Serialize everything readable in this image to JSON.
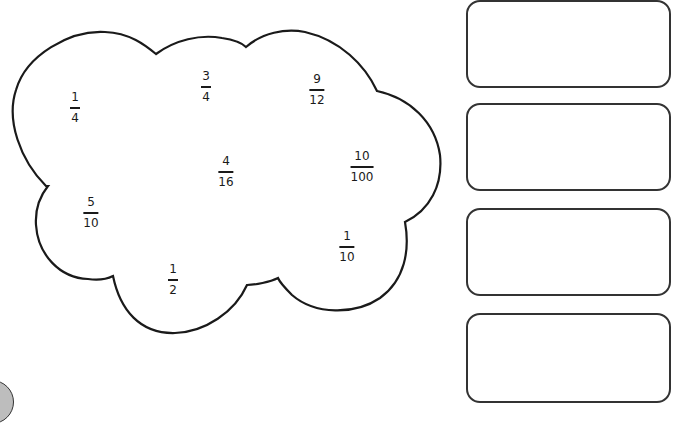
{
  "worksheet": {
    "cloud": {
      "fractions": [
        {
          "numerator": "1",
          "denominator": "4",
          "x": 75,
          "y": 91
        },
        {
          "numerator": "3",
          "denominator": "4",
          "x": 206,
          "y": 70
        },
        {
          "numerator": "9",
          "denominator": "12",
          "x": 317,
          "y": 73
        },
        {
          "numerator": "4",
          "denominator": "16",
          "x": 226,
          "y": 155
        },
        {
          "numerator": "10",
          "denominator": "100",
          "x": 362,
          "y": 150
        },
        {
          "numerator": "5",
          "denominator": "10",
          "x": 91,
          "y": 196
        },
        {
          "numerator": "1",
          "denominator": "10",
          "x": 347,
          "y": 230
        },
        {
          "numerator": "1",
          "denominator": "2",
          "x": 173,
          "y": 263
        }
      ]
    },
    "answer_boxes": [
      {
        "top": 0,
        "value": ""
      },
      {
        "top": 103,
        "value": ""
      },
      {
        "top": 208,
        "value": ""
      },
      {
        "top": 313,
        "value": ""
      }
    ],
    "colors": {
      "outline": "#1a1a1a",
      "box_border": "#333333",
      "background": "#ffffff",
      "corner_disc": "#bdbdbd"
    }
  }
}
